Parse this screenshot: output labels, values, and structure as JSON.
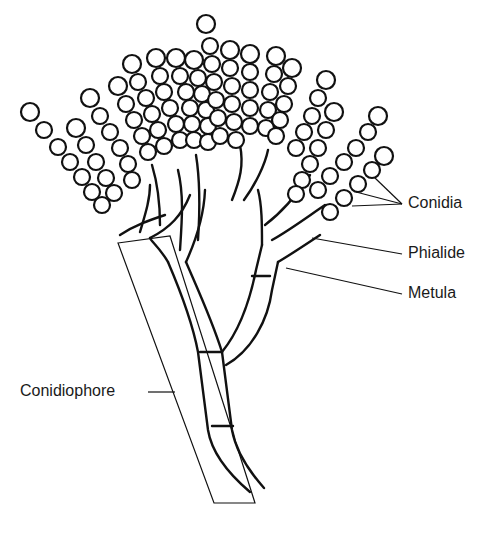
{
  "figure": {
    "ink_color": "#111111",
    "background": "#ffffff"
  },
  "labels": {
    "conidia": {
      "text": "Conidia",
      "x": 408,
      "y": 204
    },
    "phialide": {
      "text": "Phialide",
      "x": 408,
      "y": 250
    },
    "metula": {
      "text": "Metula",
      "x": 408,
      "y": 290
    },
    "conidiophore": {
      "text": "Conidiophore",
      "x": 20,
      "y": 384
    }
  }
}
